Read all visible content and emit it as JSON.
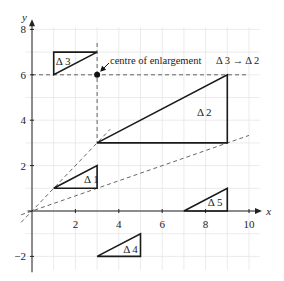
{
  "axes": {
    "x_label": "x",
    "y_label": "y",
    "x_ticks": [
      {
        "value": 2,
        "label": "2"
      },
      {
        "value": 4,
        "label": "4"
      },
      {
        "value": 6,
        "label": "6"
      },
      {
        "value": 8,
        "label": "8"
      },
      {
        "value": 10,
        "label": "10"
      }
    ],
    "y_ticks": [
      {
        "value": 8,
        "label": "8"
      },
      {
        "value": 6,
        "label": "6"
      },
      {
        "value": 4,
        "label": "4"
      },
      {
        "value": 2,
        "label": "2"
      },
      {
        "value": -2,
        "label": "−2"
      }
    ],
    "x_range": [
      -0.5,
      10.5
    ],
    "y_range": [
      -2.6,
      8.3
    ]
  },
  "triangles": [
    {
      "id": "t1",
      "label": "Δ 1",
      "vertices": [
        [
          1,
          1
        ],
        [
          3,
          1
        ],
        [
          3,
          2
        ]
      ],
      "label_at": [
        2.4,
        1.25
      ]
    },
    {
      "id": "t2",
      "label": "Δ 2",
      "vertices": [
        [
          3,
          3
        ],
        [
          9,
          3
        ],
        [
          9,
          6
        ]
      ],
      "label_at": [
        7.6,
        4.2
      ]
    },
    {
      "id": "t3",
      "label": "Δ 3",
      "vertices": [
        [
          1,
          6
        ],
        [
          1,
          7
        ],
        [
          3,
          7
        ]
      ],
      "label_at": [
        1.1,
        6.45
      ]
    },
    {
      "id": "t4",
      "label": "Δ 4",
      "vertices": [
        [
          3,
          -2
        ],
        [
          5,
          -2
        ],
        [
          5,
          -1
        ]
      ],
      "label_at": [
        4.2,
        -1.85
      ]
    },
    {
      "id": "t5",
      "label": "Δ 5",
      "vertices": [
        [
          7,
          0
        ],
        [
          9,
          0
        ],
        [
          9,
          1
        ]
      ],
      "label_at": [
        8.1,
        0.2
      ]
    }
  ],
  "construction_lines": [
    {
      "id": "horizontal-y6",
      "from": [
        0,
        6
      ],
      "to": [
        10,
        6
      ]
    },
    {
      "id": "vertical-x3",
      "from": [
        3,
        7.4
      ],
      "to": [
        3,
        3
      ]
    },
    {
      "id": "ray-steep",
      "from": [
        -0.5,
        -0.5
      ],
      "to": [
        3.6,
        3.6
      ]
    },
    {
      "id": "ray-shallow",
      "from": [
        -0.5,
        -0.167
      ],
      "to": [
        10,
        3.33
      ]
    }
  ],
  "centre_point": [
    3,
    6
  ],
  "annotations": {
    "centre_text": "centre of enlargement",
    "mapping_text": "Δ 3 → Δ 2"
  }
}
